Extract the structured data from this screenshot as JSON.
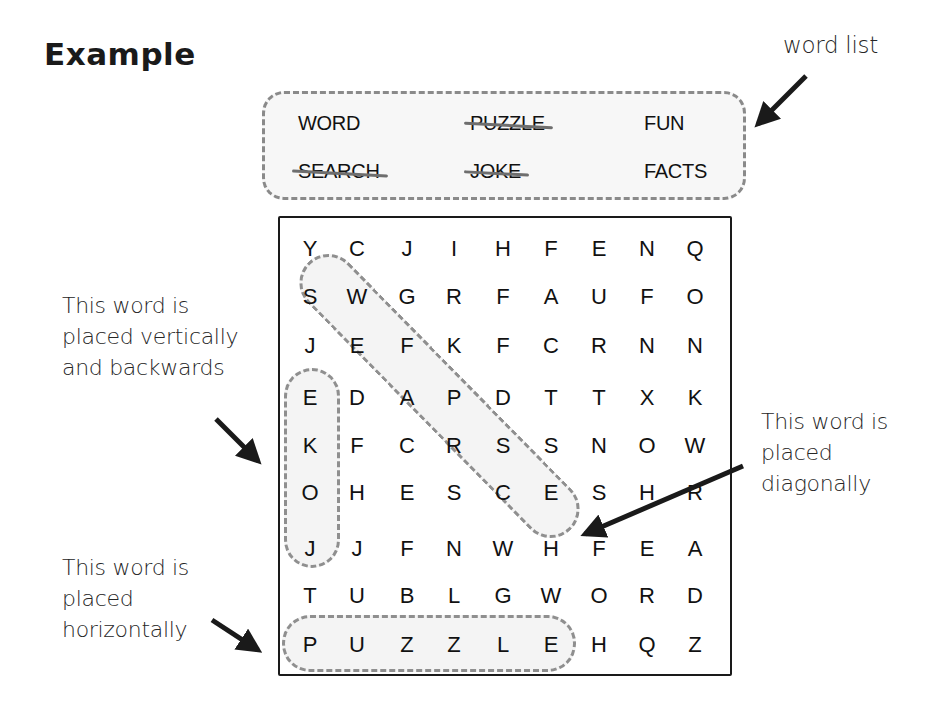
{
  "title": "Example",
  "word_list_label": "word list",
  "word_list": [
    {
      "word": "WORD",
      "found": false
    },
    {
      "word": "PUZZLE",
      "found": true
    },
    {
      "word": "FUN",
      "found": false
    },
    {
      "word": "SEARCH",
      "found": true
    },
    {
      "word": "JOKE",
      "found": true
    },
    {
      "word": "FACTS",
      "found": false
    }
  ],
  "grid": [
    [
      "Y",
      "C",
      "J",
      "I",
      "H",
      "F",
      "E",
      "N",
      "Q"
    ],
    [
      "S",
      "W",
      "G",
      "R",
      "F",
      "A",
      "U",
      "F",
      "O"
    ],
    [
      "J",
      "E",
      "F",
      "K",
      "F",
      "C",
      "R",
      "N",
      "N"
    ],
    [
      "E",
      "D",
      "A",
      "P",
      "D",
      "T",
      "T",
      "X",
      "K"
    ],
    [
      "K",
      "F",
      "C",
      "R",
      "S",
      "S",
      "N",
      "O",
      "W"
    ],
    [
      "O",
      "H",
      "E",
      "S",
      "C",
      "E",
      "S",
      "H",
      "R"
    ],
    [
      "J",
      "J",
      "F",
      "N",
      "W",
      "H",
      "F",
      "E",
      "A"
    ],
    [
      "T",
      "U",
      "B",
      "L",
      "G",
      "W",
      "O",
      "R",
      "D"
    ],
    [
      "P",
      "U",
      "Z",
      "Z",
      "L",
      "E",
      "H",
      "Q",
      "Z"
    ]
  ],
  "annotations": {
    "vertical": [
      "This word is",
      "placed vertically",
      "and backwards"
    ],
    "diagonal": [
      "This word is",
      "placed",
      "diagonally"
    ],
    "horizontal": [
      "This word is",
      "placed",
      "horizontally"
    ]
  },
  "highlights": [
    {
      "word": "JOKE",
      "direction": "vertical-backwards"
    },
    {
      "word": "SEARCH",
      "direction": "diagonal"
    },
    {
      "word": "PUZZLE",
      "direction": "horizontal"
    }
  ],
  "colors": {
    "ink": "#1a1a1a",
    "dashed": "#8a8a8a",
    "fill": "#f7f7f7"
  }
}
